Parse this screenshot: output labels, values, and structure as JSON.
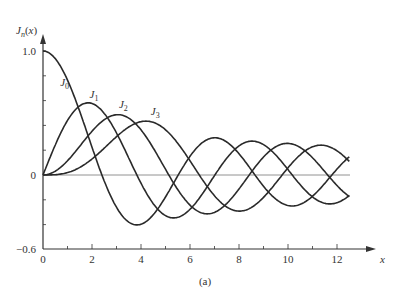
{
  "chart_data": {
    "type": "line",
    "title": "",
    "xlabel": "x",
    "ylabel": "J_n(x)",
    "caption": "(a)",
    "xlim": [
      0,
      13.2
    ],
    "ylim": [
      -0.6,
      1.1
    ],
    "x_ticks": [
      "0",
      "2",
      "4",
      "6",
      "8",
      "10",
      "12"
    ],
    "y_ticks": [
      "1.0",
      "0",
      "-0.6"
    ],
    "grid": false,
    "x": [
      0,
      0.5,
      1,
      1.5,
      2,
      2.5,
      3,
      3.5,
      4,
      4.5,
      5,
      5.5,
      6,
      6.5,
      7,
      7.5,
      8,
      8.5,
      9,
      9.5,
      10,
      10.5,
      11,
      11.5,
      12,
      12.5
    ],
    "series": [
      {
        "name": "J0",
        "values": [
          1,
          0.938,
          0.765,
          0.512,
          0.224,
          -0.048,
          -0.26,
          -0.38,
          -0.397,
          -0.321,
          -0.178,
          -0.007,
          0.151,
          0.26,
          0.3,
          0.266,
          0.172,
          0.042,
          -0.09,
          -0.194,
          -0.246,
          -0.237,
          -0.171,
          -0.068,
          0.048,
          0.147
        ]
      },
      {
        "name": "J1",
        "values": [
          0,
          0.242,
          0.44,
          0.558,
          0.577,
          0.497,
          0.339,
          0.137,
          -0.066,
          -0.231,
          -0.328,
          -0.341,
          -0.277,
          -0.154,
          -0.005,
          0.135,
          0.235,
          0.273,
          0.245,
          0.161,
          0.043,
          -0.079,
          -0.177,
          -0.228,
          -0.223,
          -0.165
        ]
      },
      {
        "name": "J2",
        "values": [
          0,
          0.031,
          0.115,
          0.232,
          0.353,
          0.446,
          0.486,
          0.459,
          0.364,
          0.218,
          0.047,
          -0.117,
          -0.243,
          -0.307,
          -0.301,
          -0.23,
          -0.113,
          0.022,
          0.145,
          0.228,
          0.255,
          0.222,
          0.139,
          0.028,
          -0.085,
          -0.173
        ]
      },
      {
        "name": "J3",
        "values": [
          0,
          0.003,
          0.02,
          0.061,
          0.129,
          0.217,
          0.309,
          0.387,
          0.43,
          0.425,
          0.365,
          0.256,
          0.115,
          -0.035,
          -0.168,
          -0.258,
          -0.291,
          -0.263,
          -0.181,
          -0.065,
          0.058,
          0.163,
          0.227,
          0.238,
          0.195,
          0.11
        ]
      }
    ],
    "annotations": [
      {
        "text": "J0",
        "x": 0.7,
        "y": 0.72
      },
      {
        "text": "J1",
        "x": 1.9,
        "y": 0.62
      },
      {
        "text": "J2",
        "x": 3.1,
        "y": 0.54
      },
      {
        "text": "J3",
        "x": 4.4,
        "y": 0.48
      }
    ]
  }
}
